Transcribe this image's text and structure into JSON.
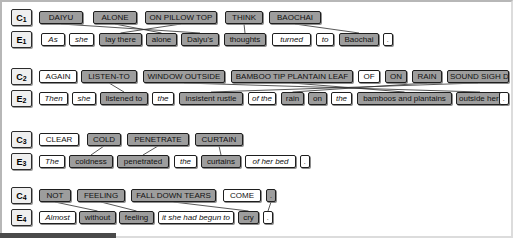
{
  "figure": {
    "type": "word-alignment-diagram",
    "colors": {
      "shaded_token_bg": "#9d9d9d",
      "light_token_bg": "#ffffff",
      "token_border": "#1e1e1e",
      "label_bg": "#efefef",
      "link_line": "#2d2d2d",
      "page_bg": "#ffffff",
      "frame_border": "#b7b7b7",
      "bottom_bar": "#4a4a4a"
    }
  },
  "blocks": [
    {
      "concept_label": "C",
      "concept_index": "1",
      "english_label": "E",
      "english_index": "1",
      "concept_tokens": [
        {
          "text": "DAIYU",
          "shaded": true,
          "x": 39,
          "w": 44
        },
        {
          "text": "ALONE",
          "shaded": true,
          "x": 93,
          "w": 44
        },
        {
          "text": "ON PILLOW TOP",
          "shaded": true,
          "x": 145,
          "w": 72
        },
        {
          "text": "THINK",
          "shaded": true,
          "x": 225,
          "w": 38
        },
        {
          "text": "BAOCHAI",
          "shaded": true,
          "x": 269,
          "w": 52
        }
      ],
      "english_tokens": [
        {
          "text": "As",
          "shaded": false,
          "x": 41,
          "w": 24
        },
        {
          "text": "she",
          "shaded": false,
          "x": 69,
          "w": 25
        },
        {
          "text": "lay there",
          "shaded": true,
          "x": 99,
          "w": 43
        },
        {
          "text": "alone",
          "shaded": true,
          "x": 146,
          "w": 31
        },
        {
          "text": "Daiyu's",
          "shaded": true,
          "x": 181,
          "w": 38
        },
        {
          "text": "thoughts",
          "shaded": true,
          "x": 224,
          "w": 42
        },
        {
          "text": "turned",
          "shaded": false,
          "x": 272,
          "w": 39
        },
        {
          "text": "to",
          "shaded": false,
          "x": 316,
          "w": 18
        },
        {
          "text": "Baochai",
          "shaded": true,
          "x": 339,
          "w": 40
        },
        {
          "text": ".",
          "shaded": false,
          "x": 383,
          "w": 10
        }
      ],
      "links": [
        {
          "from": 0,
          "to": 4
        },
        {
          "from": 1,
          "to": 3
        },
        {
          "from": 2,
          "to": 2
        },
        {
          "from": 3,
          "to": 5
        },
        {
          "from": 4,
          "to": 8
        }
      ]
    },
    {
      "concept_label": "C",
      "concept_index": "2",
      "english_label": "E",
      "english_index": "2",
      "concept_tokens": [
        {
          "text": "AGAIN",
          "shaded": false,
          "x": 39,
          "w": 38
        },
        {
          "text": "LISTEN-TO",
          "shaded": true,
          "x": 81,
          "w": 56
        },
        {
          "text": "WINDOW OUTSIDE",
          "shaded": true,
          "x": 143,
          "w": 82
        },
        {
          "text": "BAMBOO TIP PLANTAIN LEAF",
          "shaded": true,
          "x": 231,
          "w": 122
        },
        {
          "text": "OF",
          "shaded": false,
          "x": 358,
          "w": 22
        },
        {
          "text": "ON",
          "shaded": true,
          "x": 385,
          "w": 22
        },
        {
          "text": "RAIN",
          "shaded": true,
          "x": 412,
          "w": 30
        },
        {
          "text": "SOUND SIGH DRIP",
          "shaded": true,
          "x": 447,
          "w": 62
        }
      ],
      "english_tokens": [
        {
          "text": "Then",
          "shaded": false,
          "x": 39,
          "w": 29
        },
        {
          "text": "she",
          "shaded": false,
          "x": 72,
          "w": 24
        },
        {
          "text": "listened to",
          "shaded": true,
          "x": 100,
          "w": 48
        },
        {
          "text": "the",
          "shaded": false,
          "x": 152,
          "w": 22
        },
        {
          "text": "insistent rustle",
          "shaded": true,
          "x": 179,
          "w": 64
        },
        {
          "text": "of the",
          "shaded": false,
          "x": 248,
          "w": 28
        },
        {
          "text": "rain",
          "shaded": true,
          "x": 281,
          "w": 23
        },
        {
          "text": "on",
          "shaded": true,
          "x": 308,
          "w": 19
        },
        {
          "text": "the",
          "shaded": false,
          "x": 331,
          "w": 21
        },
        {
          "text": "bamboos and plantains",
          "shaded": true,
          "x": 357,
          "w": 95
        },
        {
          "text": "outside her window",
          "shaded": true,
          "x": 456,
          "w": 48
        },
        {
          "text": ".",
          "shaded": false,
          "x": 499,
          "w": 10
        }
      ],
      "links": [
        {
          "from": 1,
          "to": 2
        },
        {
          "from": 2,
          "to": 10
        },
        {
          "from": 3,
          "to": 9
        },
        {
          "from": 6,
          "to": 6
        },
        {
          "from": 7,
          "to": 4
        }
      ]
    },
    {
      "concept_label": "C",
      "concept_index": "3",
      "english_label": "E",
      "english_index": "3",
      "concept_tokens": [
        {
          "text": "CLEAR",
          "shaded": false,
          "x": 39,
          "w": 40
        },
        {
          "text": "COLD",
          "shaded": true,
          "x": 87,
          "w": 34
        },
        {
          "text": "PENETRATE",
          "shaded": true,
          "x": 127,
          "w": 62
        },
        {
          "text": "CURTAIN",
          "shaded": true,
          "x": 195,
          "w": 48
        }
      ],
      "english_tokens": [
        {
          "text": "The",
          "shaded": false,
          "x": 39,
          "w": 26
        },
        {
          "text": "coldness",
          "shaded": true,
          "x": 69,
          "w": 44
        },
        {
          "text": "penetrated",
          "shaded": true,
          "x": 117,
          "w": 52
        },
        {
          "text": "the",
          "shaded": false,
          "x": 174,
          "w": 23
        },
        {
          "text": "curtains",
          "shaded": true,
          "x": 201,
          "w": 40
        },
        {
          "text": "of her bed",
          "shaded": false,
          "x": 245,
          "w": 51
        },
        {
          "text": ".",
          "shaded": false,
          "x": 300,
          "w": 10
        }
      ],
      "links": [
        {
          "from": 1,
          "to": 1
        },
        {
          "from": 2,
          "to": 2
        },
        {
          "from": 3,
          "to": 4
        }
      ]
    },
    {
      "concept_label": "C",
      "concept_index": "4",
      "english_label": "E",
      "english_index": "4",
      "concept_tokens": [
        {
          "text": "NOT",
          "shaded": true,
          "x": 39,
          "w": 32
        },
        {
          "text": "FEELING",
          "shaded": true,
          "x": 77,
          "w": 48
        },
        {
          "text": "FALL DOWN TEARS",
          "shaded": true,
          "x": 131,
          "w": 85
        },
        {
          "text": "COME",
          "shaded": false,
          "x": 223,
          "w": 38
        },
        {
          "text": ".",
          "shaded": true,
          "x": 266,
          "w": 10
        }
      ],
      "english_tokens": [
        {
          "text": "Almost",
          "shaded": false,
          "x": 39,
          "w": 37
        },
        {
          "text": "without",
          "shaded": true,
          "x": 79,
          "w": 37
        },
        {
          "text": "feeling",
          "shaded": true,
          "x": 119,
          "w": 35
        },
        {
          "text": "it she had begun to",
          "shaded": false,
          "x": 158,
          "w": 76
        },
        {
          "text": "cry",
          "shaded": true,
          "x": 238,
          "w": 21
        },
        {
          "text": ".",
          "shaded": false,
          "x": 263,
          "w": 10
        }
      ],
      "links": [
        {
          "from": 0,
          "to": 1
        },
        {
          "from": 1,
          "to": 2
        },
        {
          "from": 2,
          "to": 4
        },
        {
          "from": 4,
          "to": 5
        }
      ]
    }
  ]
}
